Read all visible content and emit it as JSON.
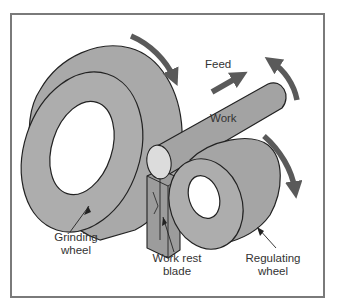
{
  "figure": {
    "labels": {
      "feed": "Feed",
      "work": "Work",
      "grinding_wheel_line1": "Grinding",
      "grinding_wheel_line2": "wheel",
      "work_rest_line1": "Work rest",
      "work_rest_line2": "blade",
      "regulating_line1": "Regulating",
      "regulating_line2": "wheel"
    },
    "colors": {
      "frame": "#7a7a7a",
      "wheel_fill": "#a9a9a9",
      "wheel_side": "#9a9a9a",
      "work_fill": "#a3a3a3",
      "work_end": "#dcdcdc",
      "arrow": "#5a5a5a",
      "outline": "#222222",
      "background": "#ffffff"
    },
    "components": [
      "grinding-wheel",
      "work-piece",
      "work-rest-blade",
      "regulating-wheel"
    ],
    "motion_arrows": [
      "grinding-wheel-rotation",
      "feed-direction",
      "work-rotation",
      "regulating-wheel-rotation"
    ]
  }
}
